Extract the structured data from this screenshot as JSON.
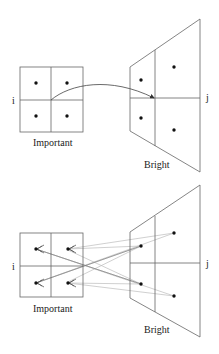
{
  "diagrams": [
    {
      "id": "top",
      "source_label": "Important",
      "target_label": "Bright",
      "source_axis_label": "i",
      "target_axis_label": "j",
      "connection": "single curved arrow from source center to target center"
    },
    {
      "id": "bottom",
      "source_label": "Important",
      "target_label": "Bright",
      "source_axis_label": "i",
      "target_axis_label": "j",
      "connection": "crossing gray lines from each target point to source points with arrowheads"
    }
  ],
  "colors": {
    "stroke": "#555555",
    "dot": "#111111",
    "light_line": "#b8b8b8",
    "text": "#222222"
  }
}
